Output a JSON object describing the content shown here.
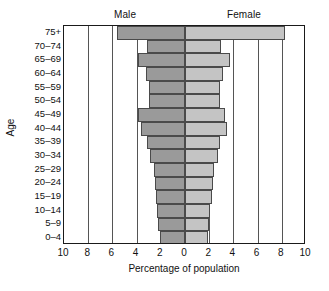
{
  "chart_data": {
    "type": "bar",
    "subtype": "population-pyramid",
    "title": "",
    "xlabel": "Percentage of population",
    "ylabel": "Age",
    "categories": [
      "0–4",
      "5–9",
      "10–14",
      "15–19",
      "20–24",
      "25–29",
      "30–34",
      "35–39",
      "40–44",
      "45–49",
      "50–54",
      "55–59",
      "60–64",
      "65–69",
      "70–74",
      "75+"
    ],
    "series": [
      {
        "name": "Male",
        "values": [
          2.1,
          2.2,
          2.3,
          2.4,
          2.5,
          2.6,
          2.9,
          3.1,
          3.6,
          3.9,
          3.0,
          3.0,
          3.2,
          3.9,
          3.1,
          5.6
        ]
      },
      {
        "name": "Female",
        "values": [
          1.9,
          2.0,
          2.1,
          2.2,
          2.3,
          2.4,
          2.7,
          2.9,
          3.5,
          3.3,
          2.9,
          2.9,
          3.1,
          3.7,
          3.0,
          8.3
        ]
      }
    ],
    "xlim": [
      -10,
      10
    ],
    "x_tick_labels": [
      "10",
      "8",
      "6",
      "4",
      "2",
      "0",
      "2",
      "4",
      "6",
      "8",
      "10"
    ],
    "x_tick_values": [
      -10,
      -8,
      -6,
      -4,
      -2,
      0,
      2,
      4,
      6,
      8,
      10
    ],
    "grid": true,
    "grid_axis": "x",
    "legend": "none",
    "colors": {
      "male": "#9a9a9a",
      "female": "#c4c4c4",
      "bar_border": "#4a4a4a",
      "frame": "#1a1a1a",
      "gridline": "#555555",
      "background": "#ffffff",
      "text": "#111111"
    }
  },
  "headers": {
    "male": "Male",
    "female": "Female"
  },
  "axes": {
    "y_title": "Age",
    "x_title": "Percentage of population"
  }
}
